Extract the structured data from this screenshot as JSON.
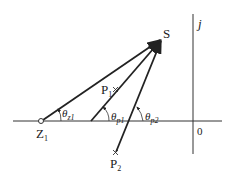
{
  "diagram": {
    "points": {
      "S": {
        "label": "S",
        "x": 161,
        "y": 40
      },
      "Z1": {
        "label": "Z",
        "sub": "1",
        "x": 41,
        "y": 121,
        "marker": "circle"
      },
      "P1": {
        "label": "P",
        "sub": "1",
        "x": 115,
        "y": 89,
        "marker": "cross"
      },
      "P2": {
        "label": "P",
        "sub": "2",
        "x": 116,
        "y": 153,
        "marker": "cross"
      }
    },
    "axes": {
      "imag_label": "j",
      "origin_label": "0"
    },
    "angles": [
      {
        "symbol": "θ",
        "sub": "z1"
      },
      {
        "symbol": "θ",
        "sub": "p1"
      },
      {
        "symbol": "θ",
        "sub": "p2"
      }
    ]
  }
}
